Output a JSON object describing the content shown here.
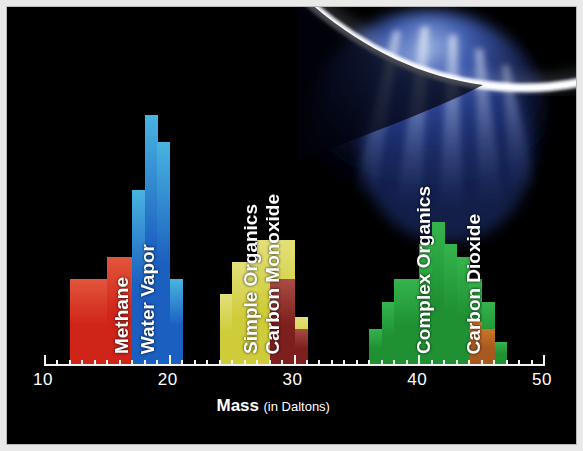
{
  "figure": {
    "background_color": "#000000",
    "frame_border_color": "#b9b9b9",
    "axis_color": "#f2f2f2",
    "text_color": "#ffffff"
  },
  "photo": {
    "name": "enceladus-plume-photo",
    "description": "Backlit crescent limb of Enceladus with a bright icy plume fanning downward",
    "limb_color": "#ffffff",
    "plume_color": "#2f53b8"
  },
  "axis": {
    "title_main": "Mass",
    "title_sub": "(in Daltons)",
    "tick_labels": [
      "10",
      "20",
      "30",
      "40",
      "50"
    ],
    "tick_values": [
      10,
      20,
      30,
      40,
      50
    ],
    "minor_tick_step": 1,
    "range": [
      10,
      50
    ]
  },
  "series_labels": [
    {
      "name": "methane-label",
      "text": "Methane",
      "x": 16.1,
      "color": "#ffffff"
    },
    {
      "name": "water-vapor-label",
      "text": "Water Vapor",
      "x": 18.2,
      "color": "#ffffff"
    },
    {
      "name": "simple-organics-label",
      "text": "Simple Organics",
      "x": 26.4,
      "color": "#ffffff"
    },
    {
      "name": "carbon-monoxide-label",
      "text": "Carbon Monoxide",
      "x": 28.2,
      "color": "#ffffff"
    },
    {
      "name": "complex-organics-label",
      "text": "Complex Organics",
      "x": 40.3,
      "color": "#ffffff"
    },
    {
      "name": "carbon-dioxide-label",
      "text": "Carbon Dioxide",
      "x": 44.3,
      "color": "#ffffff"
    }
  ],
  "chart_data": {
    "type": "bar",
    "title": "",
    "subtitle": "",
    "xlabel": "Mass (in Daltons)",
    "ylabel": "",
    "xlim": [
      10,
      50
    ],
    "ylim": [
      0,
      100
    ],
    "grid": false,
    "legend": "in-plot vertical text labels",
    "note": "Cassini INMS mass spectrum of the Enceladus plume; heights are relative signal (0-100) read off the stepped histogram.",
    "series": [
      {
        "name": "Methane",
        "color": "#cf2418",
        "color_top": "#e2553c",
        "x": [
          12,
          13,
          14,
          15,
          16,
          17
        ],
        "values": [
          34,
          34,
          34,
          43,
          43,
          58
        ]
      },
      {
        "name": "Water Vapor",
        "color": "#1b5fc0",
        "color_top": "#49b4e0",
        "x": [
          17,
          18,
          19,
          20
        ],
        "values": [
          70,
          100,
          89,
          34
        ]
      },
      {
        "name": "Simple Organics",
        "color": "#cfcc3a",
        "color_top": "#e3e07a",
        "x": [
          24,
          25,
          26,
          27,
          28,
          29,
          30
        ],
        "values": [
          28,
          41,
          41,
          50,
          50,
          50,
          19
        ]
      },
      {
        "name": "Carbon Monoxide",
        "color": "#7d1f1c",
        "color_top": "#a84c45",
        "x": [
          28,
          29,
          30
        ],
        "values": [
          34,
          34,
          14
        ]
      },
      {
        "name": "Complex Organics",
        "color": "#1f9133",
        "color_top": "#35b44c",
        "x": [
          36,
          37,
          38,
          39,
          40,
          41,
          42,
          43,
          44,
          45,
          46
        ],
        "values": [
          14,
          25,
          34,
          34,
          48,
          57,
          48,
          43,
          34,
          25,
          9
        ]
      },
      {
        "name": "Carbon Dioxide",
        "color": "#a8591e",
        "color_top": "#c9752c",
        "x": [
          44,
          45
        ],
        "values": [
          17,
          14
        ]
      }
    ]
  }
}
